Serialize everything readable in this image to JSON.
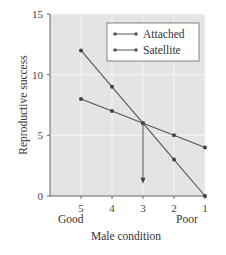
{
  "chart_data": {
    "type": "line",
    "title": "",
    "xlabel": "Male condition",
    "ylabel": "Reproductive success",
    "x": [
      5,
      4,
      3,
      2,
      1
    ],
    "x_tick_labels": [
      "5",
      "4",
      "3",
      "2",
      "1"
    ],
    "x_end_labels": {
      "left": "Good",
      "right": "Poor"
    },
    "y_ticks": [
      0,
      5,
      10,
      15
    ],
    "ylim": [
      0,
      15
    ],
    "grid": true,
    "legend_position": "upper right",
    "series": [
      {
        "name": "Attached",
        "values": [
          12,
          9,
          6,
          3,
          0
        ]
      },
      {
        "name": "Satellite",
        "values": [
          8,
          7,
          6,
          5,
          4
        ]
      }
    ],
    "annotations": [
      {
        "type": "arrow",
        "from": {
          "x": 3,
          "y": 6
        },
        "to": {
          "x": 3,
          "y": 1
        },
        "note": "crossover point at male condition 3"
      }
    ]
  },
  "colors": {
    "plot_bg": "#e4e4e4",
    "line": "#555555",
    "grid": "#f4f4f4"
  }
}
